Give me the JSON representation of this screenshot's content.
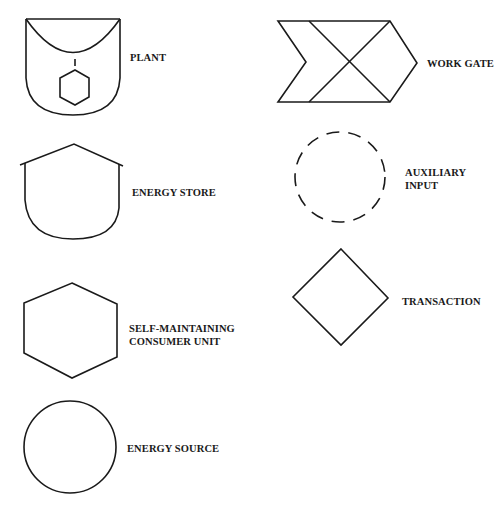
{
  "diagram": {
    "type": "symbol-legend",
    "stroke_color": "#1a1a1a",
    "background_color": "#ffffff",
    "symbols": [
      {
        "id": "plant",
        "label": "PLANT",
        "shape": "cup with inner arc, tick and hexagon"
      },
      {
        "id": "energy-store",
        "label": "ENERGY STORE",
        "shape": "tank with pitched roof and rounded bottom"
      },
      {
        "id": "self-maintaining-consumer-unit",
        "label_lines": [
          "SELF-MAINTAINING",
          "CONSUMER UNIT"
        ],
        "shape": "hexagon"
      },
      {
        "id": "energy-source",
        "label": "ENERGY SOURCE",
        "shape": "circle"
      },
      {
        "id": "work-gate",
        "label": "WORK GATE",
        "shape": "arrow-like pentagon with notch and crossing diagonals"
      },
      {
        "id": "auxiliary-input",
        "label_lines": [
          "AUXILIARY",
          "INPUT"
        ],
        "shape": "dashed circle"
      },
      {
        "id": "transaction",
        "label": "TRANSACTION",
        "shape": "diamond"
      }
    ]
  }
}
